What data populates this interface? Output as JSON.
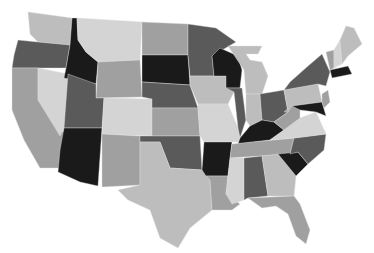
{
  "map": {
    "title": "",
    "type": "us-states-choropleth",
    "palette": [
      "#1a1a1a",
      "#5a5a5a",
      "#7d7d7d",
      "#a0a0a0",
      "#bdbdbd",
      "#d4d4d4"
    ],
    "states": [
      {
        "id": "WA",
        "name": "Washington",
        "level": 4
      },
      {
        "id": "OR",
        "name": "Oregon",
        "level": 1
      },
      {
        "id": "CA",
        "name": "California",
        "level": 3
      },
      {
        "id": "ID",
        "name": "Idaho",
        "level": 0
      },
      {
        "id": "NV",
        "name": "Nevada",
        "level": 5
      },
      {
        "id": "MT",
        "name": "Montana",
        "level": 5
      },
      {
        "id": "WY",
        "name": "Wyoming",
        "level": 3
      },
      {
        "id": "UT",
        "name": "Utah",
        "level": 1
      },
      {
        "id": "AZ",
        "name": "Arizona",
        "level": 0
      },
      {
        "id": "CO",
        "name": "Colorado",
        "level": 5
      },
      {
        "id": "NM",
        "name": "New Mexico",
        "level": 3
      },
      {
        "id": "ND",
        "name": "North Dakota",
        "level": 3
      },
      {
        "id": "SD",
        "name": "South Dakota",
        "level": 0
      },
      {
        "id": "NE",
        "name": "Nebraska",
        "level": 1
      },
      {
        "id": "KS",
        "name": "Kansas",
        "level": 3
      },
      {
        "id": "OK",
        "name": "Oklahoma",
        "level": 1
      },
      {
        "id": "TX",
        "name": "Texas",
        "level": 4
      },
      {
        "id": "MN",
        "name": "Minnesota",
        "level": 1
      },
      {
        "id": "IA",
        "name": "Iowa",
        "level": 4
      },
      {
        "id": "MO",
        "name": "Missouri",
        "level": 5
      },
      {
        "id": "AR",
        "name": "Arkansas",
        "level": 0
      },
      {
        "id": "LA",
        "name": "Louisiana",
        "level": 3
      },
      {
        "id": "WI",
        "name": "Wisconsin",
        "level": 0
      },
      {
        "id": "IL",
        "name": "Illinois",
        "level": 1
      },
      {
        "id": "MI",
        "name": "Michigan",
        "level": 4
      },
      {
        "id": "IN",
        "name": "Indiana",
        "level": 4
      },
      {
        "id": "OH",
        "name": "Ohio",
        "level": 1
      },
      {
        "id": "KY",
        "name": "Kentucky",
        "level": 0
      },
      {
        "id": "TN",
        "name": "Tennessee",
        "level": 3
      },
      {
        "id": "MS",
        "name": "Mississippi",
        "level": 5
      },
      {
        "id": "AL",
        "name": "Alabama",
        "level": 1
      },
      {
        "id": "GA",
        "name": "Georgia",
        "level": 4
      },
      {
        "id": "FL",
        "name": "Florida",
        "level": 3
      },
      {
        "id": "SC",
        "name": "South Carolina",
        "level": 0
      },
      {
        "id": "NC",
        "name": "North Carolina",
        "level": 1
      },
      {
        "id": "VA",
        "name": "Virginia",
        "level": 5
      },
      {
        "id": "WV",
        "name": "West Virginia",
        "level": 3
      },
      {
        "id": "PA",
        "name": "Pennsylvania",
        "level": 4
      },
      {
        "id": "NY",
        "name": "New York",
        "level": 1
      },
      {
        "id": "MD",
        "name": "Maryland",
        "level": 0
      },
      {
        "id": "NJ",
        "name": "New Jersey",
        "level": 3
      },
      {
        "id": "MA",
        "name": "Massachusetts",
        "level": 0
      },
      {
        "id": "VT",
        "name": "Vermont",
        "level": 3
      },
      {
        "id": "NH",
        "name": "New Hampshire",
        "level": 5
      },
      {
        "id": "ME",
        "name": "Maine",
        "level": 4
      }
    ]
  }
}
